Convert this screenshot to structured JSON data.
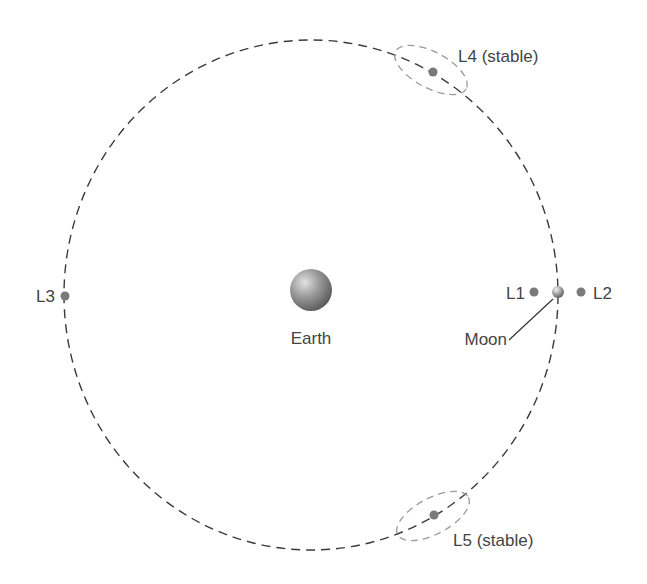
{
  "diagram": {
    "colors": {
      "orbit": "#3a3a3a",
      "lagrange_point": "#7a7a7a",
      "stability_zone": "#9a9a9a",
      "label": "#444444",
      "leader_line": "#333333"
    },
    "bodies": {
      "earth": {
        "label": "Earth",
        "x": 311,
        "y": 290,
        "r": 21
      },
      "moon": {
        "label": "Moon",
        "x": 558,
        "y": 292,
        "r": 6
      }
    },
    "orbit": {
      "cx": 311,
      "cy": 295,
      "rx": 247,
      "ry": 255,
      "style": "dashed"
    },
    "points": [
      {
        "id": "L1",
        "label": "L1",
        "x": 534,
        "y": 292
      },
      {
        "id": "L2",
        "label": "L2",
        "x": 581,
        "y": 292
      },
      {
        "id": "L3",
        "label": "L3",
        "x": 65,
        "y": 296
      },
      {
        "id": "L4",
        "label": "L4 (stable)",
        "x": 433,
        "y": 72
      },
      {
        "id": "L5",
        "label": "L5 (stable)",
        "x": 434,
        "y": 515
      }
    ]
  }
}
